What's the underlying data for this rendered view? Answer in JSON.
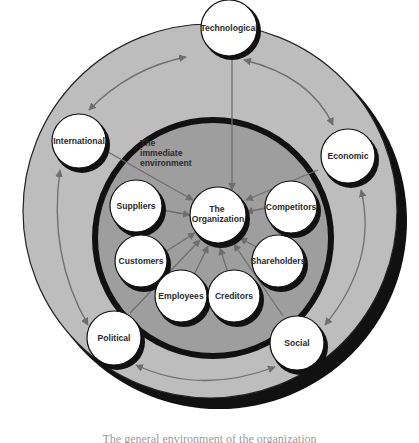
{
  "diagram": {
    "environment_label": [
      "The",
      "immediate",
      "environment"
    ],
    "center": {
      "label": [
        "The",
        "Organization"
      ]
    },
    "general_environment": [
      {
        "id": "technological",
        "label": "Technological"
      },
      {
        "id": "economic",
        "label": "Economic"
      },
      {
        "id": "social",
        "label": "Social"
      },
      {
        "id": "political",
        "label": "Political"
      },
      {
        "id": "international",
        "label": "International"
      }
    ],
    "immediate_environment": [
      {
        "id": "suppliers",
        "label": "Suppliers"
      },
      {
        "id": "customers",
        "label": "Customers"
      },
      {
        "id": "employees",
        "label": "Employees"
      },
      {
        "id": "creditors",
        "label": "Creditors"
      },
      {
        "id": "shareholders",
        "label": "Shareholders"
      },
      {
        "id": "competitors",
        "label": "Competitors"
      }
    ],
    "colors": {
      "outer_ring": "#bdbdbd",
      "inner_disc": "#9e9e9e",
      "node_fill": "#ffffff",
      "border": "#111111",
      "arrow": "#6e6e6e"
    }
  },
  "caption": "The general environment of the organization"
}
